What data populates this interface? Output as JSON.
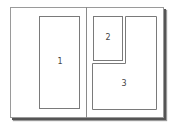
{
  "diagram": {
    "type": "page-layout",
    "regions": [
      {
        "id": 1,
        "label": "1"
      },
      {
        "id": 2,
        "label": "2"
      },
      {
        "id": 3,
        "label": "3"
      }
    ]
  },
  "colors": {
    "border": "#7a7a7a",
    "shadow": "#555555",
    "background": "#ffffff"
  }
}
